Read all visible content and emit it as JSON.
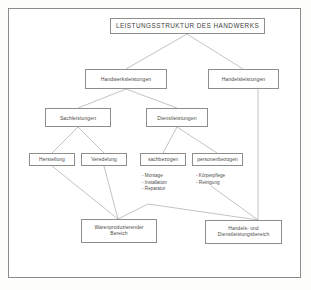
{
  "diagram": {
    "title_box": {
      "label": "LEISTUNGSSTRUKTUR DES HANDWERKS"
    },
    "level2": [
      {
        "label": "Handwerksleistungen"
      },
      {
        "label": "Handelsleistungen"
      }
    ],
    "level3": [
      {
        "label": "Sachleistungen"
      },
      {
        "label": "Dienstleistungen"
      }
    ],
    "level4": [
      {
        "label": "Herstellung"
      },
      {
        "label": "Veredelung"
      },
      {
        "label": "sachbezogen"
      },
      {
        "label": "personenbezogen"
      }
    ],
    "bullets_sachbezogen": [
      "Montage",
      "Installation",
      "Reparatur"
    ],
    "bullets_personenbezogen": [
      "Körperpflege",
      "Reinigung"
    ],
    "level5": [
      {
        "line1": "Warenproduzierender",
        "line2": "Bereich"
      },
      {
        "line1": "Handels- und",
        "line2": "Dienstleistungsbereich"
      }
    ]
  },
  "colors": {
    "box_border": "#8d8d8a",
    "connector": "#9a9a96",
    "frame": "#8b8b88",
    "text": "#4a4a48",
    "page_bg": "#fdfdfc"
  }
}
